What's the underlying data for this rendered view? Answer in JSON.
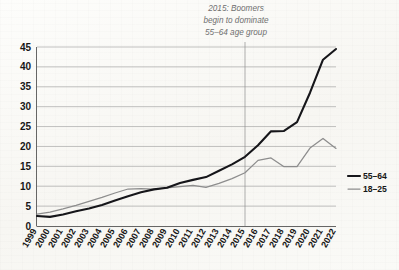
{
  "annotation": {
    "lines": [
      "2015: Boomers",
      "begin to dominate",
      "55–64 age group"
    ],
    "marker_year": "2015"
  },
  "legend": {
    "position": "right",
    "items": [
      {
        "label": "55–64",
        "color": "#16161a",
        "width": "thick"
      },
      {
        "label": "18–25",
        "color": "#8d8d8d",
        "width": "thin"
      }
    ]
  },
  "chart_data": {
    "type": "line",
    "title": "",
    "subtitle": "",
    "xlabel": "",
    "ylabel": "",
    "ylim": [
      0,
      45
    ],
    "ytick_step": 5,
    "yticks": [
      0,
      5,
      10,
      15,
      20,
      25,
      30,
      35,
      40,
      45
    ],
    "grid": true,
    "grid_axis": "y",
    "legend_position": "right",
    "annotations": [
      {
        "text": "2015: Boomers begin to dominate 55–64 age group",
        "at_x": "2015",
        "type": "vertical-reference-line"
      }
    ],
    "categories": [
      "1999",
      "2000",
      "2001",
      "2002",
      "2003",
      "2004",
      "2005",
      "2006",
      "2007",
      "2008",
      "2009",
      "2010",
      "2011",
      "2012",
      "2013",
      "2014",
      "2015",
      "2016",
      "2017",
      "2018",
      "2019",
      "2020",
      "2021",
      "2022"
    ],
    "series": [
      {
        "name": "55–64",
        "color": "#16161a",
        "values": [
          2.5,
          2.3,
          2.9,
          3.7,
          4.4,
          5.3,
          6.4,
          7.5,
          8.5,
          9.2,
          9.6,
          10.8,
          11.6,
          12.3,
          13.9,
          15.5,
          17.4,
          20.3,
          23.8,
          23.9,
          26.1,
          33.5,
          41.8,
          44.5
        ]
      },
      {
        "name": "18–25",
        "color": "#8d8d8d",
        "values": [
          3.0,
          3.5,
          4.3,
          5.2,
          6.2,
          7.2,
          8.3,
          9.3,
          9.4,
          9.3,
          9.6,
          9.9,
          10.2,
          9.7,
          10.7,
          11.9,
          13.4,
          16.5,
          17.1,
          14.9,
          14.9,
          19.6,
          22.0,
          19.5
        ]
      }
    ]
  }
}
